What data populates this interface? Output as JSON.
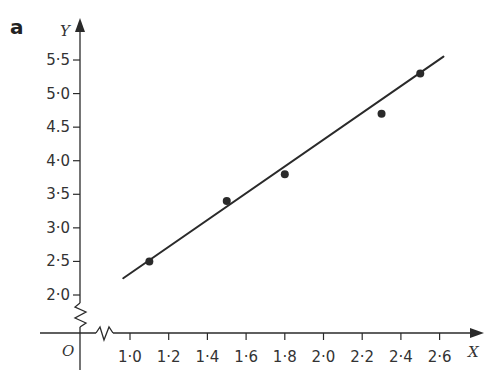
{
  "panel_label": "a",
  "colors": {
    "ink": "#2a2a2a",
    "background": "#ffffff"
  },
  "chart_data": {
    "type": "scatter",
    "title": "",
    "xlabel": "X",
    "ylabel": "Y",
    "origin_label": "O",
    "xlim": [
      0.95,
      2.7
    ],
    "ylim": [
      2.0,
      5.6
    ],
    "axis_breaks": {
      "x": true,
      "y": true
    },
    "grid": false,
    "legend": null,
    "x_ticks": [
      1.0,
      1.2,
      1.4,
      1.6,
      1.8,
      2.0,
      2.2,
      2.4,
      2.6
    ],
    "x_tick_labels": [
      "1·0",
      "1·2",
      "1·4",
      "1·6",
      "1·8",
      "2·0",
      "2·2",
      "2·4",
      "2·6"
    ],
    "y_ticks": [
      2.0,
      2.5,
      3.0,
      3.5,
      4.0,
      4.5,
      5.0,
      5.5
    ],
    "y_tick_labels": [
      "2·0",
      "2·5",
      "3·0",
      "3·5",
      "4·0",
      "4.5",
      "5·0",
      "5·5"
    ],
    "points": [
      {
        "x": 1.1,
        "y": 2.5
      },
      {
        "x": 1.5,
        "y": 3.4
      },
      {
        "x": 1.8,
        "y": 3.8
      },
      {
        "x": 2.3,
        "y": 4.7
      },
      {
        "x": 2.5,
        "y": 5.3
      }
    ],
    "fit_line": {
      "x1": 0.965,
      "y1": 2.25,
      "x2": 2.62,
      "y2": 5.55
    }
  }
}
